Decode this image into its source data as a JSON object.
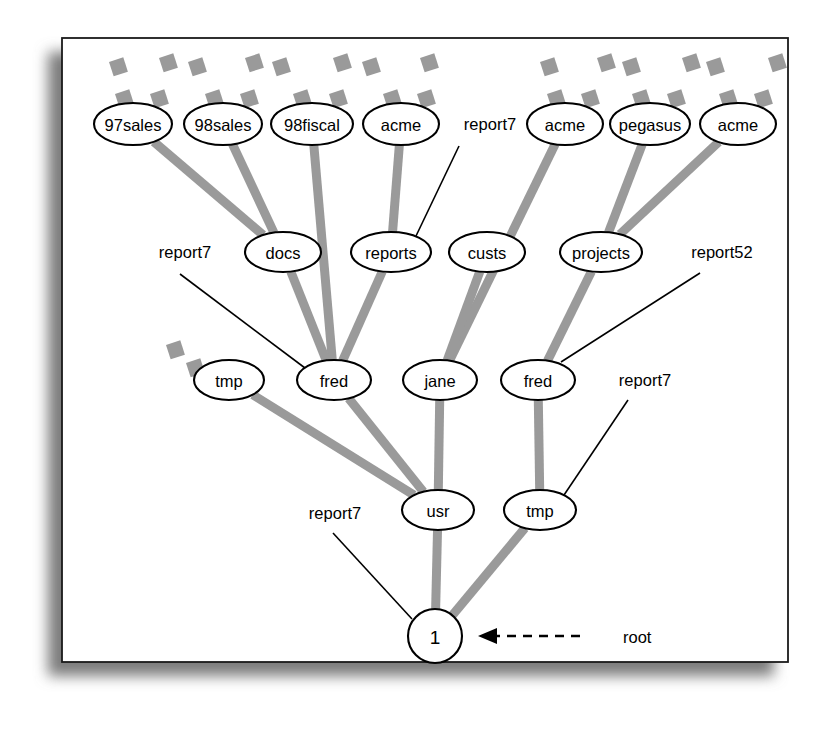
{
  "diagram": {
    "root_arrow_label": "root",
    "colors": {
      "edge_gray": "#9a9a9a",
      "stroke_black": "#000000",
      "background": "#ffffff"
    },
    "nodes": [
      {
        "id": "n97sales",
        "label": "97sales",
        "cx": 133,
        "cy": 124,
        "rx": 39,
        "ry": 21,
        "shape": "ellipse"
      },
      {
        "id": "n98sales",
        "label": "98sales",
        "cx": 223,
        "cy": 124,
        "rx": 39,
        "ry": 21,
        "shape": "ellipse"
      },
      {
        "id": "n98fiscal",
        "label": "98fiscal",
        "cx": 312,
        "cy": 124,
        "rx": 41,
        "ry": 21,
        "shape": "ellipse"
      },
      {
        "id": "nacme1",
        "label": "acme",
        "cx": 401,
        "cy": 124,
        "rx": 38,
        "ry": 21,
        "shape": "ellipse"
      },
      {
        "id": "nacme2",
        "label": "acme",
        "cx": 565,
        "cy": 124,
        "rx": 38,
        "ry": 21,
        "shape": "ellipse"
      },
      {
        "id": "npegasus",
        "label": "pegasus",
        "cx": 650,
        "cy": 124,
        "rx": 40,
        "ry": 21,
        "shape": "ellipse"
      },
      {
        "id": "nacme3",
        "label": "acme",
        "cx": 738,
        "cy": 124,
        "rx": 38,
        "ry": 21,
        "shape": "ellipse"
      },
      {
        "id": "ndocs",
        "label": "docs",
        "cx": 283,
        "cy": 252,
        "rx": 38,
        "ry": 20,
        "shape": "ellipse"
      },
      {
        "id": "nreports",
        "label": "reports",
        "cx": 391,
        "cy": 252,
        "rx": 40,
        "ry": 20,
        "shape": "ellipse"
      },
      {
        "id": "ncusts",
        "label": "custs",
        "cx": 487,
        "cy": 252,
        "rx": 38,
        "ry": 20,
        "shape": "ellipse"
      },
      {
        "id": "nprojects",
        "label": "projects",
        "cx": 601,
        "cy": 252,
        "rx": 41,
        "ry": 20,
        "shape": "ellipse"
      },
      {
        "id": "ntmp1",
        "label": "tmp",
        "cx": 229,
        "cy": 380,
        "rx": 35,
        "ry": 20,
        "shape": "ellipse"
      },
      {
        "id": "nfred1",
        "label": "fred",
        "cx": 334,
        "cy": 380,
        "rx": 37,
        "ry": 20,
        "shape": "ellipse"
      },
      {
        "id": "njane",
        "label": "jane",
        "cx": 440,
        "cy": 380,
        "rx": 37,
        "ry": 20,
        "shape": "ellipse"
      },
      {
        "id": "nfred2",
        "label": "fred",
        "cx": 538,
        "cy": 380,
        "rx": 37,
        "ry": 20,
        "shape": "ellipse"
      },
      {
        "id": "nusr",
        "label": "usr",
        "cx": 438,
        "cy": 510,
        "rx": 36,
        "ry": 20,
        "shape": "ellipse"
      },
      {
        "id": "ntmp2",
        "label": "tmp",
        "cx": 540,
        "cy": 510,
        "rx": 36,
        "ry": 20,
        "shape": "ellipse"
      },
      {
        "id": "nroot",
        "label": "1",
        "cx": 435,
        "cy": 636,
        "rx": 27,
        "ry": 27,
        "shape": "circle"
      }
    ],
    "edges": [
      {
        "from": "n97sales",
        "to": "ndocs"
      },
      {
        "from": "n98sales",
        "to": "ndocs"
      },
      {
        "from": "n98fiscal",
        "to": "nfred1"
      },
      {
        "from": "nacme1",
        "to": "nreports"
      },
      {
        "from": "ndocs",
        "to": "nfred1"
      },
      {
        "from": "nreports",
        "to": "nfred1"
      },
      {
        "from": "nacme2",
        "to": "njane"
      },
      {
        "from": "ncusts",
        "to": "njane"
      },
      {
        "from": "npegasus",
        "to": "nprojects"
      },
      {
        "from": "nacme3",
        "to": "nprojects"
      },
      {
        "from": "nprojects",
        "to": "nfred2"
      },
      {
        "from": "ntmp1",
        "to": "nusr"
      },
      {
        "from": "nfred1",
        "to": "nusr"
      },
      {
        "from": "njane",
        "to": "nusr"
      },
      {
        "from": "nfred2",
        "to": "ntmp2"
      },
      {
        "from": "nusr",
        "to": "nroot"
      },
      {
        "from": "ntmp2",
        "to": "nroot"
      }
    ],
    "annotations": [
      {
        "id": "a1",
        "label": "report7",
        "tx": 490,
        "ty": 124,
        "lx1": 459,
        "ly1": 146,
        "lx2": 416,
        "ly2": 236
      },
      {
        "id": "a2",
        "label": "report7",
        "tx": 185,
        "ty": 252,
        "lx1": 180,
        "ly1": 274,
        "lx2": 309,
        "ly2": 371
      },
      {
        "id": "a3",
        "label": "report52",
        "tx": 722,
        "ty": 252,
        "lx1": 700,
        "ly1": 273,
        "lx2": 561,
        "ly2": 362
      },
      {
        "id": "a4",
        "label": "report7",
        "tx": 645,
        "ty": 380,
        "lx1": 628,
        "ly1": 400,
        "lx2": 562,
        "ly2": 498
      },
      {
        "id": "a5",
        "label": "report7",
        "tx": 335,
        "ty": 513,
        "lx1": 333,
        "ly1": 533,
        "lx2": 412,
        "ly2": 619
      }
    ],
    "stub_squares": [
      {
        "x": 109,
        "y": 62
      },
      {
        "x": 159,
        "y": 58
      },
      {
        "x": 188,
        "y": 62
      },
      {
        "x": 245,
        "y": 58
      },
      {
        "x": 272,
        "y": 62
      },
      {
        "x": 333,
        "y": 58
      },
      {
        "x": 362,
        "y": 62
      },
      {
        "x": 420,
        "y": 58
      },
      {
        "x": 540,
        "y": 62
      },
      {
        "x": 597,
        "y": 58
      },
      {
        "x": 622,
        "y": 62
      },
      {
        "x": 682,
        "y": 58
      },
      {
        "x": 706,
        "y": 62
      },
      {
        "x": 768,
        "y": 58
      },
      {
        "x": 115,
        "y": 94
      },
      {
        "x": 150,
        "y": 94
      },
      {
        "x": 205,
        "y": 94
      },
      {
        "x": 240,
        "y": 94
      },
      {
        "x": 293,
        "y": 94
      },
      {
        "x": 329,
        "y": 94
      },
      {
        "x": 383,
        "y": 94
      },
      {
        "x": 417,
        "y": 94
      },
      {
        "x": 547,
        "y": 94
      },
      {
        "x": 581,
        "y": 94
      },
      {
        "x": 632,
        "y": 94
      },
      {
        "x": 667,
        "y": 94
      },
      {
        "x": 719,
        "y": 94
      },
      {
        "x": 754,
        "y": 94
      },
      {
        "x": 166,
        "y": 345
      },
      {
        "x": 186,
        "y": 363
      }
    ],
    "frame": {
      "x": 62,
      "y": 38,
      "width": 726,
      "height": 624
    }
  }
}
